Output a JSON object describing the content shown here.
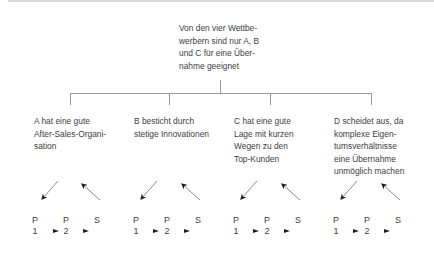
{
  "root": {
    "text": "Von den vier Wettbe-\nwerbern sind nur A, B\nund C für eine Über-\nnahme geeignet"
  },
  "leaves": [
    {
      "id": "A",
      "text": "A hat eine gute\nAfter-Sales-Organi-\nsation"
    },
    {
      "id": "B",
      "text": "B besticht durch\nstetige Innovationen"
    },
    {
      "id": "C",
      "text": "C hat eine gute\nLage mit kurzen\nWegen zu den\nTop-Kunden"
    },
    {
      "id": "D",
      "text": "D scheidet aus, da\nkomplexe Eigen-\ntumsverhältnisse\neine Übernahme\nunmöglich machen"
    }
  ],
  "flow_labels": {
    "p1_letter": "P",
    "p1_number": "1",
    "p2_letter": "P",
    "p2_number": "2",
    "s_letter": "S"
  },
  "colors": {
    "text": "#3e3e3e",
    "connector": "#9a9a9a",
    "arrow_shaft": "#8a8a8a",
    "arrow_head": "#1e1e1e"
  }
}
